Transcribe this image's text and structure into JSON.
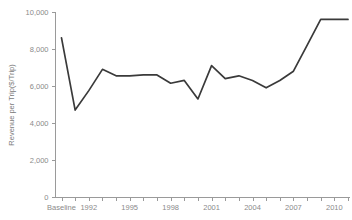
{
  "chart_data": {
    "type": "line",
    "title": "",
    "xlabel": "",
    "ylabel": "Revenue per Trip($/Trip)",
    "ylim": [
      0,
      10000
    ],
    "grid": false,
    "legend": "none",
    "y_ticks": [
      0,
      2000,
      4000,
      6000,
      8000,
      10000
    ],
    "y_tick_labels": [
      "0",
      "2,000",
      "4,000",
      "6,000",
      "8,000",
      "10,000"
    ],
    "x_tick_labels": [
      "Baseline",
      "1992",
      "1995",
      "1998",
      "2001",
      "2004",
      "2007",
      "2010"
    ],
    "x_tick_label_indices": [
      0,
      2,
      5,
      8,
      11,
      14,
      17,
      20
    ],
    "categories": [
      "Baseline",
      "1991",
      "1992",
      "1993",
      "1994",
      "1995",
      "1996",
      "1997",
      "1998",
      "1999",
      "2000",
      "2001",
      "2002",
      "2003",
      "2004",
      "2005",
      "2006",
      "2007",
      "2008",
      "2009",
      "2010",
      "2011"
    ],
    "values": [
      8600,
      4700,
      5750,
      6900,
      6550,
      6550,
      6600,
      6600,
      6150,
      6300,
      5300,
      7100,
      6400,
      6550,
      6300,
      5900,
      6300,
      6800,
      8200,
      9600,
      9600,
      9600
    ],
    "series": [
      {
        "name": "Revenue per Trip",
        "color": "#3a3a3a",
        "values": [
          8600,
          4700,
          5750,
          6900,
          6550,
          6550,
          6600,
          6600,
          6150,
          6300,
          5300,
          7100,
          6400,
          6550,
          6300,
          5900,
          6300,
          6800,
          8200,
          9600,
          9600,
          9600
        ]
      }
    ]
  },
  "axis": {
    "y_title": "Revenue per Trip($/Trip)",
    "line_color": "#9a9a9a",
    "label_color": "#8a8a8a"
  }
}
